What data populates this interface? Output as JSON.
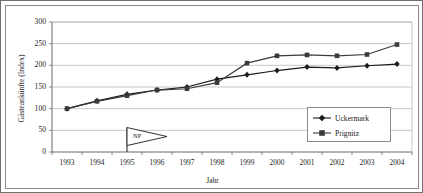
{
  "chart_data": {
    "type": "line",
    "title": "",
    "xlabel": "Jahr",
    "ylabel": "Gästeankünfte (Index)",
    "categories": [
      "1993",
      "1994",
      "1995",
      "1996",
      "1997",
      "1998",
      "1999",
      "2000",
      "2001",
      "2002",
      "2003",
      "2004"
    ],
    "x": [
      1993,
      1994,
      1995,
      1996,
      1997,
      1998,
      1999,
      2000,
      2001,
      2002,
      2003,
      2004
    ],
    "ylim": [
      0,
      300
    ],
    "yticks": [
      "0",
      "50",
      "100",
      "150",
      "200",
      "250",
      "300"
    ],
    "ytick_values": [
      0,
      50,
      100,
      150,
      200,
      250,
      300
    ],
    "grid": "horizontal",
    "legend_position": "bottom-right",
    "series": [
      {
        "name": "Uckermark",
        "marker": "diamond",
        "color": "#1b1b1b",
        "values": [
          100,
          118,
          133,
          143,
          150,
          168,
          178,
          188,
          196,
          194,
          199,
          203
        ]
      },
      {
        "name": "Prignitz",
        "marker": "square",
        "color": "#3a3a3a",
        "values": [
          100,
          117,
          130,
          143,
          146,
          160,
          205,
          222,
          224,
          222,
          225,
          248
        ]
      }
    ],
    "annotations": [
      {
        "name": "np-flag",
        "label": "NP",
        "x": 1995,
        "y": 38,
        "shape": "pennant-flag"
      }
    ]
  },
  "legend": {
    "items": [
      {
        "label": "Uckermark"
      },
      {
        "label": "Prignitz"
      }
    ]
  },
  "axes": {
    "y_title": "Gästeankünfte (Index)",
    "x_title": "Jahr"
  }
}
